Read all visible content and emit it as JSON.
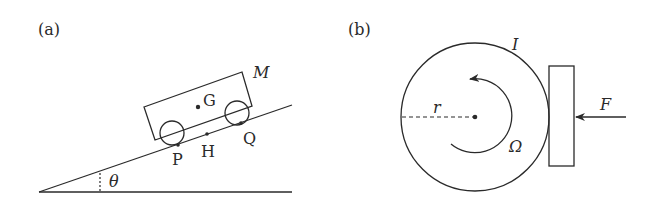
{
  "panel_a": {
    "label": "(a)",
    "mass_label": "M",
    "center_of_mass_label": "G",
    "rear_contact_label": "P",
    "mid_point_label": "H",
    "front_contact_label": "Q",
    "angle_label": "θ"
  },
  "panel_b": {
    "label": "(b)",
    "moment_of_inertia_label": "I",
    "radius_label": "r",
    "angular_velocity_label": "Ω",
    "force_label": "F"
  }
}
